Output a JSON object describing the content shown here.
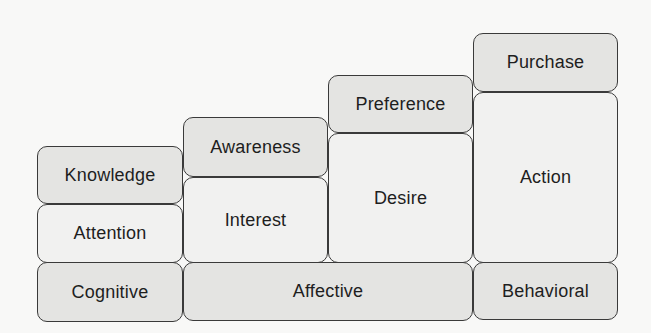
{
  "diagram": {
    "type": "hierarchy-of-effects",
    "columns": [
      {
        "stages": [
          "Knowledge",
          "Attention"
        ],
        "category": "Cognitive"
      },
      {
        "stages": [
          "Awareness",
          "Interest"
        ],
        "category": "Affective"
      },
      {
        "stages": [
          "Preference",
          "Desire"
        ],
        "category": "Affective"
      },
      {
        "stages": [
          "Purchase",
          "Action"
        ],
        "category": "Behavioral"
      }
    ],
    "categories": [
      "Cognitive",
      "Affective",
      "Behavioral"
    ],
    "colors": {
      "shaded": "#e4e4e2",
      "light": "#f1f1f0",
      "border": "#3a3a3a",
      "text": "#1e1e1e"
    }
  }
}
